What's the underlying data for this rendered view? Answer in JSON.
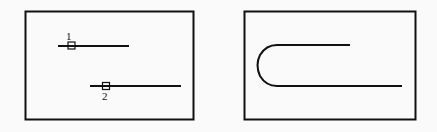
{
  "panels": [
    {
      "id": "before",
      "description": "Two separate horizontal line segments with endpoint grips selected",
      "markers": [
        {
          "label": "1",
          "kind": "grip-square"
        },
        {
          "label": "2",
          "kind": "grip-square"
        }
      ]
    },
    {
      "id": "after",
      "description": "Line segments joined by a fillet arc forming a U shape"
    }
  ],
  "colors": {
    "stroke": "#111111",
    "background": "#fafafa"
  }
}
